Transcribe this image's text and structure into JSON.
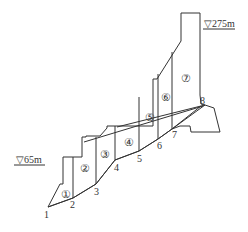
{
  "diagram": {
    "type": "dam-section-slices",
    "elevations": {
      "top": "▽275m",
      "water": "▽65m"
    },
    "points": [
      {
        "label": "1",
        "x": 48,
        "y": 207
      },
      {
        "label": "2",
        "x": 73,
        "y": 198
      },
      {
        "label": "3",
        "x": 96,
        "y": 184
      },
      {
        "label": "4",
        "x": 115,
        "y": 160
      },
      {
        "label": "5",
        "x": 139,
        "y": 151
      },
      {
        "label": "6",
        "x": 158,
        "y": 139
      },
      {
        "label": "7",
        "x": 172,
        "y": 129
      },
      {
        "label": "8",
        "x": 201,
        "y": 106
      }
    ],
    "slices": [
      "①",
      "②",
      "③",
      "④",
      "⑤",
      "⑥",
      "⑦"
    ]
  }
}
